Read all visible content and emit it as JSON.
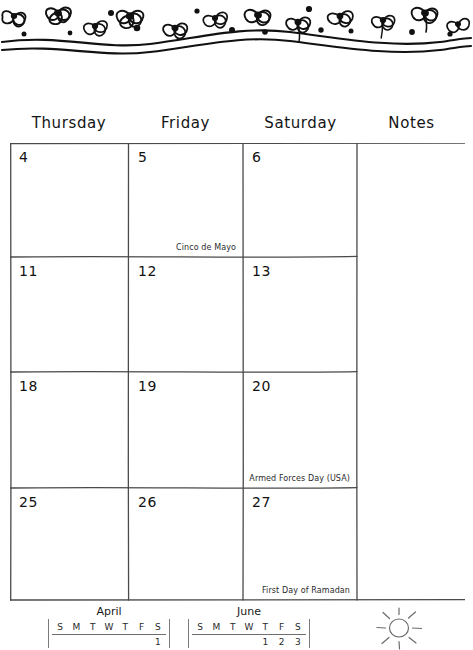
{
  "page": {
    "kind": "printable-monthly-calendar-page",
    "month": "May",
    "decoration_top": "hand-drawn-flowers-and-wavy-lines",
    "decoration_bottom_right": "hand-drawn-sun"
  },
  "header": {
    "columns": [
      {
        "label": "Thursday"
      },
      {
        "label": "Friday"
      },
      {
        "label": "Saturday"
      },
      {
        "label": "Notes"
      }
    ]
  },
  "grid": {
    "weeks": [
      {
        "days": [
          {
            "number": "4",
            "event": ""
          },
          {
            "number": "5",
            "event": "Cinco de Mayo"
          },
          {
            "number": "6",
            "event": ""
          }
        ]
      },
      {
        "days": [
          {
            "number": "11",
            "event": ""
          },
          {
            "number": "12",
            "event": ""
          },
          {
            "number": "13",
            "event": ""
          }
        ]
      },
      {
        "days": [
          {
            "number": "18",
            "event": ""
          },
          {
            "number": "19",
            "event": ""
          },
          {
            "number": "20",
            "event": "Armed Forces Day (USA)"
          }
        ]
      },
      {
        "days": [
          {
            "number": "25",
            "event": ""
          },
          {
            "number": "26",
            "event": ""
          },
          {
            "number": "27",
            "event": "First Day of Ramadan"
          }
        ]
      }
    ],
    "notes_column": {
      "content": ""
    }
  },
  "mini_calendars": [
    {
      "title": "April",
      "dow": [
        "S",
        "M",
        "T",
        "W",
        "T",
        "F",
        "S"
      ],
      "weeks": [
        [
          "",
          "",
          "",
          "",
          "",
          "",
          "1"
        ]
      ]
    },
    {
      "title": "June",
      "dow": [
        "S",
        "M",
        "T",
        "W",
        "T",
        "F",
        "S"
      ],
      "weeks": [
        [
          "",
          "",
          "",
          "",
          "1",
          "2",
          "3"
        ]
      ]
    }
  ],
  "colors": {
    "ink": "#1a1a1a",
    "rule": "#555555",
    "paper": "#ffffff",
    "event_text": "#2b2b2b"
  }
}
